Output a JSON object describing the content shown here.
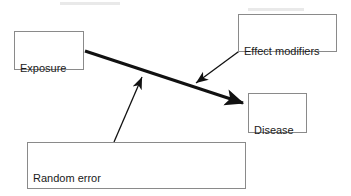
{
  "diagram": {
    "background_color": "#ffffff",
    "border_color": "#8a8a8a",
    "edge_color": "#111111",
    "nodes": [
      {
        "id": "exposure",
        "label": "Exposure",
        "x": 14,
        "y": 31,
        "width": 70,
        "height": 39
      },
      {
        "id": "effect_modifiers",
        "label": "Effect modifiers",
        "x": 238,
        "y": 14,
        "width": 99,
        "height": 38
      },
      {
        "id": "disease",
        "label": "Disease",
        "x": 248,
        "y": 93,
        "width": 59,
        "height": 40
      },
      {
        "id": "error",
        "label_line1": "Random error",
        "label_line2": "Systematic error (bias, confounding)",
        "x": 27,
        "y": 142,
        "width": 219,
        "height": 47
      }
    ],
    "edges": [
      {
        "id": "exposure-to-disease",
        "from": "exposure",
        "to": "disease",
        "style": "thick",
        "stroke_width": 3,
        "x1": 85,
        "y1": 51,
        "x2": 247,
        "y2": 104,
        "arrowhead": "end"
      },
      {
        "id": "effect-modifiers-to-main-arrow",
        "from": "effect_modifiers",
        "to": "exposure-to-disease",
        "style": "thin",
        "stroke_width": 1.3,
        "x1": 257,
        "y1": 38,
        "x2": 193,
        "y2": 85,
        "arrowhead": "end"
      },
      {
        "id": "error-to-main-arrow",
        "from": "error",
        "to": "exposure-to-disease",
        "style": "thin",
        "stroke_width": 1.3,
        "x1": 114,
        "y1": 142,
        "x2": 143,
        "y2": 73,
        "arrowhead": "end"
      }
    ]
  }
}
